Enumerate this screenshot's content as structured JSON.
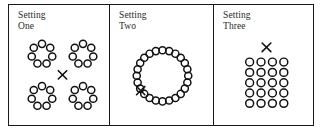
{
  "figure": {
    "width": 322,
    "height": 135,
    "background": "#ffffff",
    "stroke_color": "#111111",
    "border_color": "#1a1a1a"
  },
  "panels": [
    {
      "id": "setting-one",
      "label": "Setting\nOne",
      "label_line1": "Setting",
      "label_line2": "One",
      "layout": "four-clusters",
      "cluster_count": 4,
      "circles_per_cluster": 7,
      "total_circles": 28,
      "cross_count": 1,
      "cross_position": "center",
      "cluster_centers": [
        {
          "cx": 33,
          "cy": 50
        },
        {
          "cx": 74,
          "cy": 50
        },
        {
          "cx": 33,
          "cy": 93
        },
        {
          "cx": 74,
          "cy": 93
        }
      ],
      "cluster_radius": 10.5,
      "circle_radius": 3.6,
      "cross": {
        "cx": 53.5,
        "cy": 71,
        "size": 4.2
      }
    },
    {
      "id": "setting-two",
      "label": "Setting\nTwo",
      "label_line1": "Setting",
      "label_line2": "Two",
      "layout": "single-large-ring",
      "cluster_count": 1,
      "circles_in_ring": 24,
      "total_circles": 24,
      "cross_count": 1,
      "cross_position": "inside-ring-lower-left",
      "ring_center": {
        "cx": 53,
        "cy": 72
      },
      "ring_radius": 26,
      "circle_radius": 3.6,
      "cross": {
        "cx": 31,
        "cy": 87,
        "size": 4.2
      }
    },
    {
      "id": "setting-three",
      "label": "Setting\nThree",
      "label_line1": "Setting",
      "label_line2": "Three",
      "layout": "grid",
      "grid_columns": 4,
      "grid_rows": 5,
      "total_circles": 20,
      "cross_count": 1,
      "cross_position": "above-grid",
      "grid_origin": {
        "x": 36,
        "y": 58
      },
      "grid_spacing": {
        "x": 11.5,
        "y": 10.5
      },
      "circle_radius": 4.0,
      "cross": {
        "cx": 53,
        "cy": 43,
        "size": 4.4
      }
    }
  ]
}
